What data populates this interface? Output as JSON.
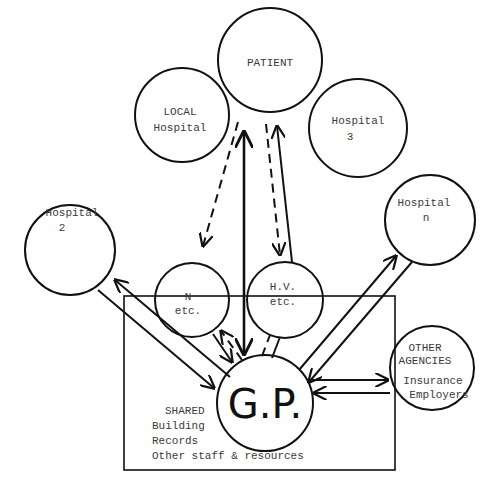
{
  "diagram": {
    "nodes": {
      "patient": {
        "label": "PATIENT"
      },
      "local_hospital": {
        "line1": "LOCAL",
        "line2": "Hospital"
      },
      "hospital_3": {
        "line1": "Hospital",
        "line2": "3"
      },
      "hospital_2": {
        "line1": "Hospital",
        "line2": "2"
      },
      "hospital_n": {
        "line1": "Hospital",
        "line2": "n"
      },
      "nurse": {
        "line1": "N",
        "line2": "etc."
      },
      "health_visitor": {
        "line1": "H.V.",
        "line2": "etc."
      },
      "gp": {
        "label": "G.P."
      },
      "other_agencies": {
        "line1": "OTHER",
        "line2": "AGENCIES",
        "line3": "Insurance",
        "line4": "Employers"
      }
    },
    "shared_box": {
      "title": "SHARED",
      "items": [
        "Building",
        "Records",
        "Other staff & resources"
      ]
    },
    "edges": [
      {
        "from": "gp",
        "to": "patient",
        "style": "solid-double-arrow"
      },
      {
        "from": "patient",
        "to": "nurse",
        "style": "dashed-arrow"
      },
      {
        "from": "patient",
        "to": "health_visitor",
        "style": "dashed-arrow"
      },
      {
        "from": "health_visitor",
        "to": "patient",
        "style": "solid-arrow"
      },
      {
        "from": "gp",
        "to": "hospital_2",
        "style": "double-line-arrows"
      },
      {
        "from": "gp",
        "to": "hospital_n",
        "style": "double-line-arrows"
      },
      {
        "from": "gp",
        "to": "nurse",
        "style": "solid-and-dashed-arrows"
      },
      {
        "from": "gp",
        "to": "health_visitor",
        "style": "dashed-pair"
      },
      {
        "from": "gp",
        "to": "other_agencies",
        "style": "double-line-arrows"
      }
    ]
  }
}
